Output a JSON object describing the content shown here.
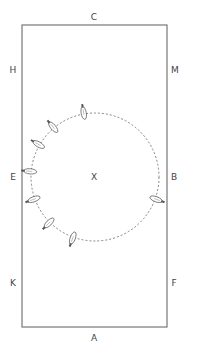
{
  "arena": {
    "markers": {
      "top": "C",
      "bottom": "A",
      "left_upper": "H",
      "left_middle": "E",
      "left_lower": "K",
      "right_upper": "M",
      "right_middle": "B",
      "right_lower": "F",
      "center": "X"
    },
    "border_color": "#777777",
    "circle": {
      "cx": 95,
      "cy": 177,
      "r": 64,
      "style": "dashed"
    },
    "horses": [
      {
        "angle": -100
      },
      {
        "angle": -130
      },
      {
        "angle": -150
      },
      {
        "angle": -175
      },
      {
        "angle": 160
      },
      {
        "angle": 135
      },
      {
        "angle": 110
      },
      {
        "angle": 20
      }
    ]
  }
}
